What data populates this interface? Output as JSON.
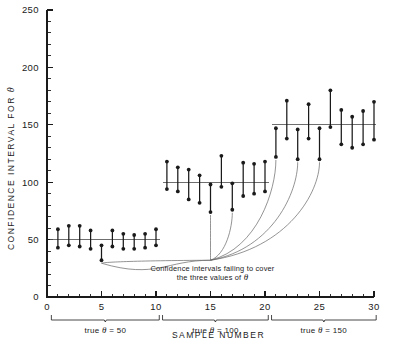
{
  "chart_data": {
    "type": "scatter",
    "title": "",
    "xlabel": "SAMPLE NUMBER",
    "ylabel": "CONFIDENCE INTERVAL FOR θ",
    "xlim": [
      0,
      30
    ],
    "ylim": [
      0,
      250
    ],
    "grid": false,
    "legend": null,
    "x_ticks_major": [
      0,
      5,
      10,
      15,
      20,
      25,
      30
    ],
    "x_tick_labels": [
      "0",
      "5",
      "10",
      "15",
      "20",
      "25",
      "30"
    ],
    "x_tick_minor_step": 1,
    "y_ticks_major": [
      0,
      50,
      100,
      150,
      200,
      250
    ],
    "y_tick_labels": [
      "0",
      "50",
      "100",
      "150",
      "200",
      "250"
    ],
    "y_tick_minor_step": 10,
    "reference_lines": [
      {
        "value": 50,
        "x_start": 0.3,
        "x_end": 10.4,
        "label": "true θ = 50"
      },
      {
        "value": 100,
        "x_start": 10.6,
        "x_end": 20.4,
        "label": "true θ = 100"
      },
      {
        "value": 150,
        "x_start": 20.6,
        "x_end": 30.2,
        "label": "true θ = 150"
      }
    ],
    "groups": [
      {
        "name": "true θ = 50",
        "true_value": 50,
        "x_range": [
          0.4,
          10.3
        ],
        "label": "true θ = 50"
      },
      {
        "name": "true θ = 100",
        "true_value": 100,
        "x_range": [
          10.6,
          20.3
        ],
        "label": "true θ = 100"
      },
      {
        "name": "true θ = 150",
        "true_value": 150,
        "x_range": [
          20.6,
          30.2
        ],
        "label": "true θ = 150"
      }
    ],
    "series": [
      {
        "name": "Confidence intervals",
        "intervals": [
          {
            "sample": 1,
            "lower": 43,
            "upper": 59,
            "covers": true,
            "group": 0
          },
          {
            "sample": 2,
            "lower": 45,
            "upper": 62,
            "covers": true,
            "group": 0
          },
          {
            "sample": 3,
            "lower": 44,
            "upper": 62,
            "covers": true,
            "group": 0
          },
          {
            "sample": 4,
            "lower": 42,
            "upper": 58,
            "covers": true,
            "group": 0
          },
          {
            "sample": 5,
            "lower": 32,
            "upper": 45,
            "covers": false,
            "group": 0
          },
          {
            "sample": 6,
            "lower": 44,
            "upper": 58,
            "covers": true,
            "group": 0
          },
          {
            "sample": 7,
            "lower": 42,
            "upper": 55,
            "covers": true,
            "group": 0
          },
          {
            "sample": 8,
            "lower": 42,
            "upper": 54,
            "covers": true,
            "group": 0
          },
          {
            "sample": 9,
            "lower": 43,
            "upper": 55,
            "covers": true,
            "group": 0
          },
          {
            "sample": 10,
            "lower": 45,
            "upper": 59,
            "covers": true,
            "group": 0
          },
          {
            "sample": 11,
            "lower": 94,
            "upper": 118,
            "covers": true,
            "group": 1
          },
          {
            "sample": 12,
            "lower": 92,
            "upper": 113,
            "covers": true,
            "group": 1
          },
          {
            "sample": 13,
            "lower": 85,
            "upper": 111,
            "covers": true,
            "group": 1
          },
          {
            "sample": 14,
            "lower": 82,
            "upper": 106,
            "covers": true,
            "group": 1
          },
          {
            "sample": 15,
            "lower": 74,
            "upper": 98,
            "covers": false,
            "group": 1
          },
          {
            "sample": 16,
            "lower": 96,
            "upper": 123,
            "covers": true,
            "group": 1
          },
          {
            "sample": 17,
            "lower": 76,
            "upper": 99,
            "covers": false,
            "group": 1
          },
          {
            "sample": 18,
            "lower": 88,
            "upper": 117,
            "covers": true,
            "group": 1
          },
          {
            "sample": 19,
            "lower": 90,
            "upper": 116,
            "covers": true,
            "group": 1
          },
          {
            "sample": 20,
            "lower": 92,
            "upper": 118,
            "covers": true,
            "group": 1
          },
          {
            "sample": 21,
            "lower": 122,
            "upper": 147,
            "covers": false,
            "group": 2
          },
          {
            "sample": 22,
            "lower": 138,
            "upper": 171,
            "covers": true,
            "group": 2
          },
          {
            "sample": 23,
            "lower": 120,
            "upper": 146,
            "covers": false,
            "group": 2
          },
          {
            "sample": 24,
            "lower": 138,
            "upper": 168,
            "covers": true,
            "group": 2
          },
          {
            "sample": 25,
            "lower": 120,
            "upper": 147,
            "covers": false,
            "group": 2
          },
          {
            "sample": 26,
            "lower": 148,
            "upper": 180,
            "covers": true,
            "group": 2
          },
          {
            "sample": 27,
            "lower": 133,
            "upper": 163,
            "covers": true,
            "group": 2
          },
          {
            "sample": 28,
            "lower": 130,
            "upper": 157,
            "covers": true,
            "group": 2
          },
          {
            "sample": 29,
            "lower": 133,
            "upper": 162,
            "covers": true,
            "group": 2
          },
          {
            "sample": 30,
            "lower": 137,
            "upper": 170,
            "covers": true,
            "group": 2
          }
        ]
      }
    ],
    "annotations": [
      {
        "id": "failing-intervals",
        "line1": "Confidence intervals failing to cover",
        "line2": "the three values of θ",
        "anchor_x": 15.0,
        "anchor_y": 32,
        "points_to_samples": [
          5,
          15,
          17,
          21,
          23,
          25
        ]
      }
    ],
    "colors": {
      "ink": "#1a1a1a",
      "reference_line": "#555555",
      "leader_line": "#666666",
      "background": "#ffffff"
    }
  },
  "axis": {
    "y_title_parts": {
      "main": "CONFIDENCE  INTERVAL  FOR",
      "symbol": "θ"
    },
    "x_title": "SAMPLE  NUMBER"
  },
  "annotation": {
    "line1": "Confidence  intervals  failing  to  cover",
    "line2": "the  three  values  of",
    "symbol": "θ"
  },
  "group_labels": {
    "g0_prefix": "true",
    "g0_symbol": "θ",
    "g0_value": "= 50",
    "g1_prefix": "true",
    "g1_symbol": "θ",
    "g1_value": "= 100",
    "g2_prefix": "true",
    "g2_symbol": "θ",
    "g2_value": "= 150"
  }
}
